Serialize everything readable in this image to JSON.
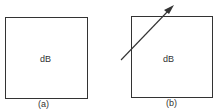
{
  "panels": [
    {
      "id": "a",
      "box_label": "dB",
      "caption": "(a)"
    },
    {
      "id": "b",
      "box_label": "dB",
      "caption": "(b)",
      "arrow": "diagonal arrow crossing top-left corner pointing up-right"
    }
  ]
}
